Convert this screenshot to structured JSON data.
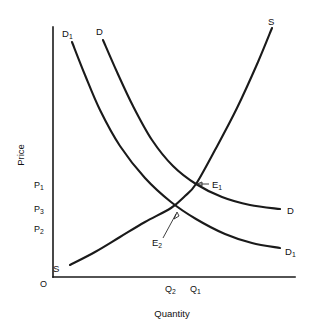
{
  "figure": {
    "background": "#ffffff",
    "ink_color": "#1a1a1a",
    "width": 311,
    "height": 335
  },
  "chart_data": {
    "type": "line",
    "title": "",
    "subtitle": "",
    "xlabel": "Quantity",
    "ylabel": "Price",
    "grid": false,
    "legend_position": "inline-curve-labels",
    "axes": {
      "origin_label": "O",
      "x_axis": {
        "label": "Quantity",
        "ticks": [
          "Q2",
          "Q1"
        ],
        "tick_display": [
          "Q",
          "Q"
        ],
        "tick_subscripts": [
          "2",
          "1"
        ]
      },
      "y_axis": {
        "label": "Price",
        "ticks": [
          "P1",
          "P3",
          "P2"
        ],
        "tick_display": [
          "P",
          "P",
          "P"
        ],
        "tick_subscripts": [
          "1",
          "3",
          "2"
        ]
      }
    },
    "series": [
      {
        "name": "S",
        "role": "supply",
        "label_start": "S",
        "label_end": "S",
        "shape": "upward-sloping convex",
        "points": [
          [
            70,
            265
          ],
          [
            95,
            252
          ],
          [
            120,
            237
          ],
          [
            145,
            222
          ],
          [
            171,
            208
          ],
          [
            185,
            196
          ],
          [
            196,
            184
          ],
          [
            215,
            150
          ],
          [
            237,
            108
          ],
          [
            258,
            62
          ],
          [
            272,
            28
          ]
        ]
      },
      {
        "name": "D1-shifted-left",
        "role": "demand",
        "label_start": "D1",
        "label_end": "D1",
        "shape": "downward-sloping convex",
        "points": [
          [
            72,
            42
          ],
          [
            85,
            75
          ],
          [
            100,
            110
          ],
          [
            120,
            146
          ],
          [
            145,
            178
          ],
          [
            171,
            202
          ],
          [
            196,
            219
          ],
          [
            225,
            234
          ],
          [
            252,
            243
          ],
          [
            280,
            248
          ]
        ]
      },
      {
        "name": "D",
        "role": "demand",
        "label_start": "D",
        "label_end": "D",
        "shape": "downward-sloping convex",
        "points": [
          [
            103,
            40
          ],
          [
            117,
            72
          ],
          [
            133,
            106
          ],
          [
            152,
            140
          ],
          [
            173,
            166
          ],
          [
            196,
            184
          ],
          [
            222,
            197
          ],
          [
            250,
            205
          ],
          [
            280,
            209
          ]
        ]
      }
    ],
    "equilibria": [
      {
        "name": "E1",
        "display": "E",
        "subscript": "1",
        "x_px": 196,
        "y_px": 184,
        "quantity": "Q1",
        "price": "P1",
        "label_x": 212,
        "label_y": 187
      },
      {
        "name": "E2",
        "display": "E",
        "subscript": "2",
        "x_px": 171,
        "y_px": 208,
        "quantity": "Q2",
        "price": "P3",
        "label_x": 156,
        "label_y": 245
      }
    ],
    "price_levels": [
      {
        "id": "P1",
        "display": "P",
        "subscript": "1",
        "y_px": 184,
        "line_style": "solid",
        "x_end": 196,
        "label_x": 36,
        "label_y": 187
      },
      {
        "id": "P3",
        "display": "P",
        "subscript": "3",
        "y_px": 208,
        "line_style": "solid",
        "x_end": 171,
        "label_x": 36,
        "label_y": 211
      },
      {
        "id": "P2",
        "display": "P",
        "subscript": "2",
        "y_px": 228,
        "line_style": "dashed",
        "x_end": 196,
        "label_x": 36,
        "label_y": 231
      }
    ],
    "quantity_levels": [
      {
        "id": "Q2",
        "display": "Q",
        "subscript": "2",
        "x_px": 171,
        "y_top": 208,
        "label_x": 166,
        "label_y": 291
      },
      {
        "id": "Q1",
        "display": "Q",
        "subscript": "1",
        "x_px": 196,
        "y_top": 184,
        "label_x": 191,
        "label_y": 291
      }
    ],
    "shaded_regions": [
      {
        "name": "price-gap-hatch",
        "hatch": "horizontal",
        "x0": 55,
        "x1": 88,
        "y0": 209,
        "y1": 227,
        "meaning": "price difference band between P3 and P2 at the axis"
      },
      {
        "name": "quantity-gap-hatch",
        "hatch": "vertical",
        "x0": 172,
        "x1": 195,
        "y0": 256,
        "y1": 276,
        "meaning": "quantity difference band between Q2 and Q1 above the x-axis"
      }
    ],
    "plot_box": {
      "x_axis_y": 277,
      "y_axis_x": 53,
      "x_axis_x_end": 295,
      "y_axis_y_top": 27
    }
  },
  "labels": {
    "price_axis_title": "Price",
    "quantity_axis_title": "Quantity",
    "origin": "O",
    "supply_top": "S",
    "supply_bottom": "S",
    "demand_top": "D",
    "demand_right": "D",
    "demand1_top": "D",
    "demand1_right": "D",
    "sub_one": "1",
    "sub_two": "2",
    "sub_three": "3",
    "p_letter": "P",
    "q_letter": "Q",
    "e_letter": "E"
  }
}
